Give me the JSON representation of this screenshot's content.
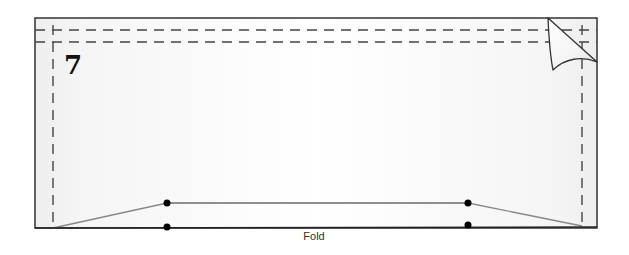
{
  "diagram": {
    "step_number": "7",
    "fold_label": "Fold",
    "colors": {
      "paper_fill": "#f7f7f7",
      "paper_edge": "#333333",
      "dashed_line": "#444444",
      "stitch_line": "#222222",
      "slant_line": "#888888",
      "dot": "#000000",
      "flap_fill": "#ffffff"
    },
    "paper": {
      "x": 35,
      "y": 18,
      "width": 562,
      "height": 210
    },
    "fold_lines": {
      "top_horizontal_1_y": 30,
      "top_horizontal_2_y": 42,
      "left_vertical_x": 53,
      "right_vertical_x": 582
    },
    "markers": [
      {
        "x": 167,
        "y": 203
      },
      {
        "x": 167,
        "y": 227
      },
      {
        "x": 468,
        "y": 203
      },
      {
        "x": 468,
        "y": 225
      }
    ]
  }
}
